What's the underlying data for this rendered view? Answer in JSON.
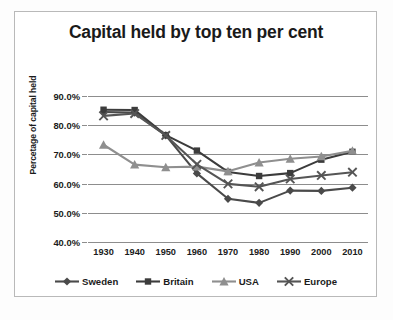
{
  "figure": {
    "title": "Capital held by top ten per cent",
    "y_axis_title": "Percetage of capital held",
    "frame_color": "#b9b9b9",
    "background": "#ffffff"
  },
  "chart_data": {
    "type": "line",
    "title": "Capital held by top ten per cent",
    "xlabel": "",
    "ylabel": "Percetage of capital held",
    "categories": [
      "1930",
      "1940",
      "1950",
      "1960",
      "1970",
      "1980",
      "1990",
      "2000",
      "2010"
    ],
    "x_tick_labels": [
      "1930",
      "1940",
      "1950",
      "1960",
      "1970",
      "1980",
      "1990",
      "2000",
      "2010"
    ],
    "y_tick_labels": [
      "90.0%",
      "80.0%",
      "70.0%",
      "60.0%",
      "50.0%",
      "40.0%"
    ],
    "y_tick_values": [
      90.0,
      80.0,
      70.0,
      60.0,
      50.0,
      40.0
    ],
    "ylim": [
      40.0,
      90.0
    ],
    "grid": "horizontal",
    "legend_position": "bottom",
    "series": [
      {
        "name": "Sweden",
        "marker": "diamond",
        "color": "#4a4a4a",
        "values": [
          84.5,
          84.3,
          76.5,
          63.5,
          54.8,
          53.4,
          57.6,
          57.5,
          58.6
        ]
      },
      {
        "name": "Britain",
        "marker": "square",
        "color": "#3c3c3c",
        "values": [
          85.3,
          85.2,
          76.6,
          71.3,
          64.0,
          62.6,
          63.6,
          68.2,
          70.9
        ]
      },
      {
        "name": "USA",
        "marker": "triangle",
        "color": "#8f8f8f",
        "values": [
          73.3,
          66.5,
          65.6,
          65.8,
          64.2,
          67.2,
          68.5,
          69.3,
          71.2
        ]
      },
      {
        "name": "Europe",
        "marker": "cross",
        "color": "#555555",
        "values": [
          83.2,
          84.0,
          76.5,
          66.6,
          59.9,
          58.9,
          61.6,
          62.8,
          63.9
        ]
      }
    ]
  },
  "legend": {
    "items": [
      {
        "label": "Sweden",
        "marker": "diamond",
        "color": "#4a4a4a"
      },
      {
        "label": "Britain",
        "marker": "square",
        "color": "#3c3c3c"
      },
      {
        "label": "USA",
        "marker": "triangle",
        "color": "#8f8f8f"
      },
      {
        "label": "Europe",
        "marker": "cross",
        "color": "#555555"
      }
    ]
  }
}
